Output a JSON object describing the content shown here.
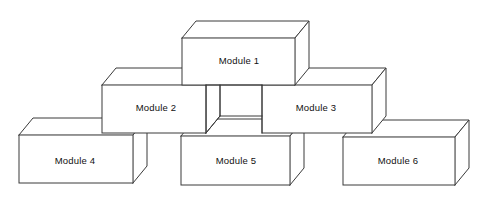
{
  "diagram": {
    "type": "isometric-block-stack",
    "background_color": "#ffffff",
    "line_color": "#3a3a3a",
    "face_color": "#ffffff",
    "text_color": "#111111",
    "projection": {
      "depth_dx": 14,
      "depth_dy": -17
    },
    "levels": [
      {
        "name": "top",
        "module_labels": [
          "Module 1"
        ]
      },
      {
        "name": "middle",
        "module_labels": [
          "Module 2",
          "Module 3"
        ]
      },
      {
        "name": "bottom",
        "module_labels": [
          "Module 4",
          "Module 5",
          "Module 6"
        ]
      }
    ],
    "modules": [
      {
        "id": "module-1",
        "label": "Module 1",
        "level": "top",
        "front": {
          "x": 182,
          "y": 38,
          "w": 113,
          "h": 47
        },
        "label_pos": {
          "x": 239,
          "y": 61
        }
      },
      {
        "id": "module-2",
        "label": "Module 2",
        "level": "middle",
        "front": {
          "x": 102,
          "y": 85,
          "w": 104,
          "h": 48
        },
        "label_pos": {
          "x": 156,
          "y": 108
        }
      },
      {
        "id": "module-3",
        "label": "Module 3",
        "level": "middle",
        "front": {
          "x": 262,
          "y": 85,
          "w": 110,
          "h": 48
        },
        "label_pos": {
          "x": 316,
          "y": 108
        }
      },
      {
        "id": "module-4",
        "label": "Module 4",
        "level": "bottom",
        "front": {
          "x": 19,
          "y": 135,
          "w": 114,
          "h": 48
        },
        "label_pos": {
          "x": 75,
          "y": 161
        }
      },
      {
        "id": "module-5",
        "label": "Module 5",
        "level": "bottom",
        "front": {
          "x": 181,
          "y": 136,
          "w": 109,
          "h": 49
        },
        "label_pos": {
          "x": 236,
          "y": 161
        }
      },
      {
        "id": "module-6",
        "label": "Module 6",
        "level": "bottom",
        "front": {
          "x": 343,
          "y": 137,
          "w": 112,
          "h": 48
        },
        "label_pos": {
          "x": 398,
          "y": 161
        }
      }
    ]
  }
}
